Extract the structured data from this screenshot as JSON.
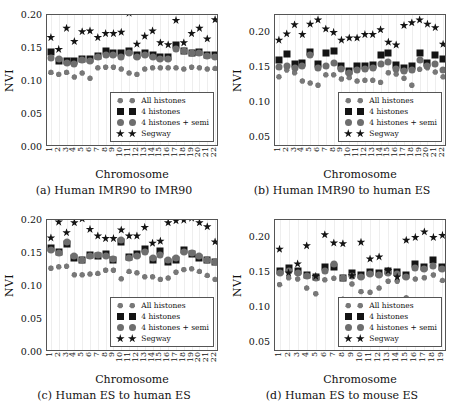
{
  "figure": {
    "axis_titles": {
      "x": "Chromosome",
      "y": "NVI"
    },
    "legend": {
      "entries": [
        {
          "label": "All histones",
          "marker": "heptagon-marker",
          "color": "#787878"
        },
        {
          "label": "4 histones",
          "marker": "square-marker",
          "color": "#141414"
        },
        {
          "label": "4 histones + semi",
          "marker": "circle-marker",
          "color": "#6e6e6e"
        },
        {
          "label": "Segway",
          "marker": "star-marker",
          "color": "#141414"
        }
      ]
    },
    "captions": {
      "a": "(a) Human IMR90 to IMR90",
      "b": "(b) Human IMR90 to human ES",
      "c": "(c) Human ES to human ES",
      "d": "(d) Human ES to mouse ES"
    }
  },
  "chart_data": [
    {
      "panel": "a",
      "type": "scatter",
      "title": "(a) Human IMR90 to IMR90",
      "xlabel": "Chromosome",
      "ylabel": "NVI",
      "ylim": [
        0.0,
        0.2
      ],
      "yticks": [
        "0.00",
        "0.05",
        "0.10",
        "0.15",
        "0.20"
      ],
      "ytick_values": [
        0.0,
        0.05,
        0.1,
        0.15,
        0.2
      ],
      "grid": "vertical",
      "legend_position": "lower-right",
      "categories": [
        "1",
        "2",
        "3",
        "4",
        "5",
        "6",
        "7",
        "8",
        "9",
        "10",
        "11",
        "12",
        "13",
        "14",
        "15",
        "16",
        "17",
        "18",
        "19",
        "20",
        "21",
        "22"
      ],
      "series": [
        {
          "name": "All histones",
          "marker": "heptagon",
          "color": "#787878",
          "values": [
            0.113,
            0.11,
            0.113,
            0.106,
            0.112,
            0.104,
            0.12,
            0.121,
            0.121,
            0.118,
            0.112,
            0.11,
            0.118,
            0.12,
            0.12,
            0.12,
            0.12,
            0.118,
            0.121,
            0.12,
            0.118,
            0.119
          ]
        },
        {
          "name": "4 histones",
          "marker": "square",
          "color": "#141414",
          "values": [
            0.144,
            0.131,
            0.13,
            0.131,
            0.134,
            0.133,
            0.138,
            0.145,
            0.142,
            0.142,
            0.146,
            0.139,
            0.143,
            0.14,
            0.136,
            0.136,
            0.155,
            0.145,
            0.143,
            0.144,
            0.14,
            0.139
          ]
        },
        {
          "name": "4 histones + semi",
          "marker": "circle",
          "color": "#6e6e6e",
          "values": [
            0.135,
            0.134,
            0.128,
            0.126,
            0.132,
            0.13,
            0.137,
            0.139,
            0.14,
            0.137,
            0.142,
            0.136,
            0.14,
            0.136,
            0.134,
            0.134,
            0.148,
            0.146,
            0.142,
            0.142,
            0.138,
            0.137
          ]
        },
        {
          "name": "Segway",
          "marker": "star",
          "color": "#141414",
          "values": [
            0.166,
            0.148,
            0.18,
            0.16,
            0.175,
            0.176,
            0.166,
            0.172,
            0.172,
            0.174,
            0.203,
            0.156,
            0.168,
            0.176,
            0.158,
            0.155,
            0.192,
            0.158,
            0.172,
            0.18,
            0.164,
            0.193
          ]
        }
      ]
    },
    {
      "panel": "b",
      "type": "scatter",
      "title": "(b) Human IMR90 to human ES",
      "xlabel": "Chromosome",
      "ylabel": "NVI",
      "ylim": [
        0.035,
        0.225
      ],
      "yticks": [
        "0.05",
        "0.10",
        "0.15",
        "0.20"
      ],
      "ytick_values": [
        0.05,
        0.1,
        0.15,
        0.2
      ],
      "grid": "vertical",
      "legend_position": "lower-right",
      "categories": [
        "1",
        "2",
        "3",
        "4",
        "5",
        "6",
        "7",
        "8",
        "9",
        "10",
        "11",
        "12",
        "13",
        "14",
        "15",
        "16",
        "17",
        "18",
        "19",
        "20",
        "21",
        "22"
      ],
      "series": [
        {
          "name": "All histones",
          "marker": "heptagon",
          "color": "#787878",
          "values": [
            0.136,
            0.146,
            0.142,
            0.13,
            0.127,
            0.124,
            0.139,
            0.139,
            0.133,
            0.135,
            0.13,
            0.131,
            0.131,
            0.128,
            0.142,
            0.14,
            0.134,
            0.124,
            0.147,
            0.149,
            0.143,
            0.136
          ]
        },
        {
          "name": "4 histones",
          "marker": "square",
          "color": "#141414",
          "values": [
            0.16,
            0.169,
            0.154,
            0.156,
            0.172,
            0.155,
            0.171,
            0.173,
            0.151,
            0.144,
            0.152,
            0.152,
            0.153,
            0.167,
            0.17,
            0.153,
            0.149,
            0.151,
            0.171,
            0.156,
            0.168,
            0.161
          ]
        },
        {
          "name": "4 histones + semi",
          "marker": "circle",
          "color": "#6e6e6e",
          "values": [
            0.15,
            0.152,
            0.148,
            0.151,
            0.167,
            0.149,
            0.152,
            0.156,
            0.147,
            0.141,
            0.146,
            0.147,
            0.149,
            0.154,
            0.158,
            0.147,
            0.144,
            0.146,
            0.16,
            0.151,
            0.155,
            0.146
          ]
        },
        {
          "name": "Segway",
          "marker": "star",
          "color": "#141414",
          "values": [
            0.189,
            0.198,
            0.211,
            0.197,
            0.212,
            0.218,
            0.205,
            0.2,
            0.189,
            0.192,
            0.192,
            0.197,
            0.197,
            0.204,
            0.186,
            0.182,
            0.21,
            0.214,
            0.218,
            0.212,
            0.207,
            0.183
          ]
        }
      ]
    },
    {
      "panel": "c",
      "type": "scatter",
      "title": "(c) Human ES to human ES",
      "xlabel": "Chromosome",
      "ylabel": "NVI",
      "ylim": [
        0.0,
        0.2
      ],
      "yticks": [
        "0.00",
        "0.05",
        "0.10",
        "0.15",
        "0.20"
      ],
      "ytick_values": [
        0.0,
        0.05,
        0.1,
        0.15,
        0.2
      ],
      "grid": "vertical",
      "legend_position": "lower-right",
      "categories": [
        "1",
        "2",
        "3",
        "4",
        "5",
        "6",
        "7",
        "8",
        "9",
        "10",
        "11",
        "12",
        "13",
        "14",
        "15",
        "16",
        "17",
        "18",
        "19",
        "20",
        "21",
        "22"
      ],
      "series": [
        {
          "name": "All histones",
          "marker": "heptagon",
          "color": "#787878",
          "values": [
            0.127,
            0.129,
            0.13,
            0.117,
            0.117,
            0.118,
            0.119,
            0.124,
            0.124,
            0.111,
            0.122,
            0.12,
            0.114,
            0.114,
            0.11,
            0.112,
            0.121,
            0.125,
            0.126,
            0.122,
            0.116,
            0.11
          ]
        },
        {
          "name": "4 histones",
          "marker": "square",
          "color": "#141414",
          "values": [
            0.158,
            0.152,
            0.163,
            0.142,
            0.139,
            0.147,
            0.146,
            0.148,
            0.139,
            0.167,
            0.144,
            0.148,
            0.156,
            0.14,
            0.153,
            0.137,
            0.14,
            0.155,
            0.148,
            0.143,
            0.139,
            0.137
          ]
        },
        {
          "name": "4 histones + semi",
          "marker": "circle",
          "color": "#6e6e6e",
          "values": [
            0.155,
            0.15,
            0.167,
            0.145,
            0.14,
            0.146,
            0.147,
            0.146,
            0.141,
            0.17,
            0.143,
            0.145,
            0.152,
            0.142,
            0.147,
            0.139,
            0.142,
            0.152,
            0.15,
            0.145,
            0.14,
            0.137
          ]
        },
        {
          "name": "Segway",
          "marker": "star",
          "color": "#141414",
          "values": [
            0.173,
            0.197,
            0.181,
            0.196,
            0.202,
            0.186,
            0.176,
            0.172,
            0.172,
            0.185,
            0.176,
            0.176,
            0.189,
            0.165,
            0.168,
            0.196,
            0.199,
            0.2,
            0.203,
            0.196,
            0.19,
            0.167
          ]
        }
      ]
    },
    {
      "panel": "d",
      "type": "scatter",
      "title": "(d) Human ES to mouse ES",
      "xlabel": "Chromosome",
      "ylabel": "NVI",
      "ylim": [
        0.035,
        0.225
      ],
      "yticks": [
        "0.05",
        "0.10",
        "0.15",
        "0.20"
      ],
      "ytick_values": [
        0.05,
        0.1,
        0.15,
        0.2
      ],
      "grid": "vertical",
      "legend_position": "lower-right",
      "categories": [
        "1",
        "2",
        "3",
        "4",
        "5",
        "6",
        "7",
        "8",
        "9",
        "10",
        "11",
        "12",
        "13",
        "14",
        "15",
        "16",
        "17",
        "18",
        "19"
      ],
      "series": [
        {
          "name": "All histones",
          "marker": "heptagon",
          "color": "#787878",
          "values": [
            0.132,
            0.142,
            0.14,
            0.127,
            0.119,
            0.139,
            0.141,
            0.111,
            0.133,
            0.122,
            0.121,
            0.127,
            0.137,
            0.137,
            0.113,
            0.14,
            0.142,
            0.146,
            0.138
          ]
        },
        {
          "name": "4 histones",
          "marker": "square",
          "color": "#141414",
          "values": [
            0.152,
            0.156,
            0.152,
            0.146,
            0.143,
            0.157,
            0.158,
            0.142,
            0.149,
            0.146,
            0.15,
            0.149,
            0.152,
            0.15,
            0.146,
            0.161,
            0.157,
            0.168,
            0.157
          ]
        },
        {
          "name": "4 histones + semi",
          "marker": "circle",
          "color": "#6e6e6e",
          "values": [
            0.149,
            0.152,
            0.148,
            0.144,
            0.142,
            0.152,
            0.161,
            0.141,
            0.145,
            0.143,
            0.147,
            0.146,
            0.148,
            0.147,
            0.143,
            0.156,
            0.155,
            0.159,
            0.154
          ]
        },
        {
          "name": "Segway",
          "marker": "star",
          "color": "#141414",
          "values": [
            0.183,
            0.149,
            0.162,
            0.188,
            0.144,
            0.204,
            0.192,
            0.191,
            0.145,
            0.193,
            0.169,
            0.172,
            0.152,
            0.143,
            0.196,
            0.2,
            0.208,
            0.2,
            0.203
          ]
        }
      ]
    }
  ]
}
